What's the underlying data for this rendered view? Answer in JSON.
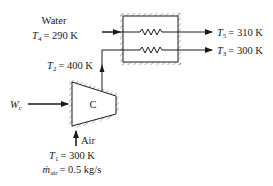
{
  "diagram": {
    "type": "compressor-heat-exchanger",
    "compressor": {
      "label": "C"
    },
    "work_input": {
      "symbol": "W",
      "subscript": "c"
    },
    "inlet": {
      "fluid": "Air",
      "temperature": {
        "symbol": "T",
        "subscript": "1",
        "value": "= 300 K"
      },
      "mass_flow": {
        "symbol": "ṁ",
        "subscript": "air",
        "value": "= 0.5 kg/s"
      }
    },
    "compressor_exit": {
      "symbol": "T",
      "subscript": "2",
      "value": "= 400 K"
    },
    "water_inlet": {
      "fluid": "Water",
      "temperature": {
        "symbol": "T",
        "subscript": "4",
        "value": "= 290 K"
      }
    },
    "water_outlet": {
      "symbol": "T",
      "subscript": "5",
      "value": "= 310 K"
    },
    "air_outlet": {
      "symbol": "T",
      "subscript": "3",
      "value": "= 300 K"
    },
    "colors": {
      "line": "#1a1a1a",
      "background": "#ffffff"
    }
  }
}
